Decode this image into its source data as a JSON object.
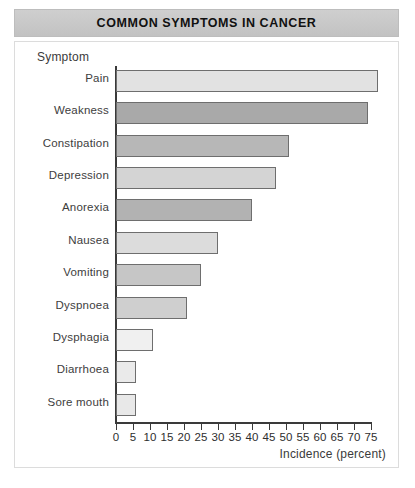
{
  "header": {
    "title": "COMMON SYMPTOMS IN CANCER"
  },
  "chart_data": {
    "type": "bar",
    "orientation": "horizontal",
    "title": "COMMON SYMPTOMS IN CANCER",
    "xlabel": "Incidence (percent)",
    "ylabel": "Symptom",
    "xlim": [
      0,
      75
    ],
    "xticks": [
      0,
      5,
      10,
      15,
      20,
      25,
      30,
      35,
      40,
      45,
      50,
      55,
      60,
      65,
      70,
      75
    ],
    "grid": false,
    "legend": "none",
    "categories": [
      "Pain",
      "Weakness",
      "Constipation",
      "Depression",
      "Anorexia",
      "Nausea",
      "Vomiting",
      "Dyspnoea",
      "Dysphagia",
      "Diarrhoea",
      "Sore mouth"
    ],
    "values": [
      77,
      74,
      51,
      47,
      40,
      30,
      25,
      21,
      11,
      6,
      6
    ],
    "bar_colors": [
      "#e2e2e2",
      "#a9a9a9",
      "#b7b7b7",
      "#d4d4d4",
      "#b2b2b2",
      "#dcdcdc",
      "#c6c6c6",
      "#cfcfcf",
      "#f0f0f0",
      "#eaeaea",
      "#e8e8e8"
    ]
  },
  "style": {
    "banner_color": "#c8c8c8",
    "axis_color": "#3a3a3a",
    "bar_border_color": "#6e6e6e"
  }
}
